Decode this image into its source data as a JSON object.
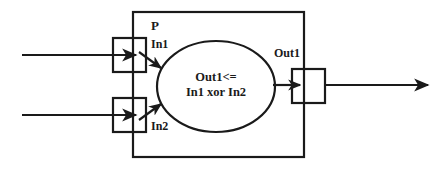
{
  "diagram": {
    "title": "P",
    "process_label": "P",
    "ports": {
      "input_1_label": "In1",
      "input_2_label": "In2",
      "output_1_label": "Out1"
    },
    "body": {
      "expression_line_1": "Out1<=",
      "expression_line_2": "In1 xor In2"
    },
    "colors": {
      "stroke": "#1a1a1a",
      "background": "#ffffff",
      "text": "#1a1a1a"
    },
    "shapes": {
      "outer_rect_name": "process-boundary",
      "ellipse_name": "process-body",
      "input_port_1_name": "input-port-in1",
      "input_port_2_name": "input-port-in2",
      "output_port_name": "output-port-out1"
    }
  }
}
